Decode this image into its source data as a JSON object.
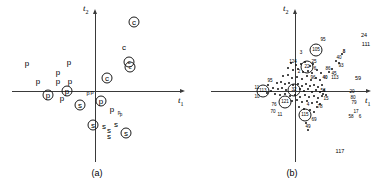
{
  "figure": {
    "panels": [
      {
        "id": "a",
        "caption": "(a)",
        "axes": {
          "x_label": "t",
          "x_sub": "1",
          "y_label": "t",
          "y_sub": "2"
        },
        "origin": {
          "x": 95,
          "y": 91
        },
        "markers": [
          {
            "label": "p",
            "x": 27,
            "y": 64,
            "circled": false,
            "size": "big"
          },
          {
            "label": "p",
            "x": 69,
            "y": 63,
            "circled": false,
            "size": "big"
          },
          {
            "label": "p",
            "x": 58,
            "y": 73,
            "circled": false,
            "size": "big"
          },
          {
            "label": "p",
            "x": 38,
            "y": 82,
            "circled": false,
            "size": "big"
          },
          {
            "label": "p",
            "x": 58,
            "y": 82,
            "circled": false,
            "size": "big"
          },
          {
            "label": "p",
            "x": 70,
            "y": 82,
            "circled": false,
            "size": "big"
          },
          {
            "label": "p",
            "x": 48,
            "y": 95,
            "circled": true,
            "size": "big"
          },
          {
            "label": "p",
            "x": 67,
            "y": 91,
            "circled": true,
            "size": "big"
          },
          {
            "label": "p",
            "x": 62,
            "y": 99,
            "circled": false,
            "size": "big"
          },
          {
            "label": "p",
            "x": 88,
            "y": 94,
            "circled": false,
            "size": "small"
          },
          {
            "label": "p",
            "x": 92,
            "y": 93,
            "circled": false,
            "size": "small"
          },
          {
            "label": "p",
            "x": 101,
            "y": 101,
            "circled": true,
            "size": "big"
          },
          {
            "label": "p",
            "x": 112,
            "y": 110,
            "circled": false,
            "size": "big"
          },
          {
            "label": "p",
            "x": 119,
            "y": 113,
            "circled": false,
            "size": "tiny"
          },
          {
            "label": "p",
            "x": 121,
            "y": 115,
            "circled": false,
            "size": "tiny"
          },
          {
            "label": "s",
            "x": 80,
            "y": 105,
            "circled": true,
            "size": "big"
          },
          {
            "label": "s",
            "x": 93,
            "y": 125,
            "circled": true,
            "size": "big"
          },
          {
            "label": "s",
            "x": 104,
            "y": 127,
            "circled": false,
            "size": "big"
          },
          {
            "label": "s",
            "x": 116,
            "y": 125,
            "circled": false,
            "size": "big"
          },
          {
            "label": "s",
            "x": 109,
            "y": 131,
            "circled": false,
            "size": "big"
          },
          {
            "label": "s",
            "x": 109,
            "y": 137,
            "circled": false,
            "size": "big"
          },
          {
            "label": "s",
            "x": 126,
            "y": 133,
            "circled": true,
            "size": "big"
          },
          {
            "label": "c",
            "x": 134,
            "y": 22,
            "circled": true,
            "size": "big"
          },
          {
            "label": "c",
            "x": 124,
            "y": 48,
            "circled": false,
            "size": "big"
          },
          {
            "label": "c",
            "x": 129,
            "y": 62,
            "circled": true,
            "size": "small"
          },
          {
            "label": "c",
            "x": 130,
            "y": 67,
            "circled": true,
            "size": "small"
          },
          {
            "label": "c",
            "x": 107,
            "y": 78,
            "circled": true,
            "size": "big"
          }
        ]
      },
      {
        "id": "b",
        "caption": "(b)",
        "axes": {
          "x_label": "t",
          "x_sub": "1",
          "y_label": "t",
          "y_sub": "2"
        },
        "origin": {
          "x": 100,
          "y": 91
        },
        "labels": [
          {
            "text": "24",
            "x": 169,
            "y": 36,
            "size": "small"
          },
          {
            "text": "111",
            "x": 171,
            "y": 45,
            "size": "small"
          },
          {
            "text": "95",
            "x": 128,
            "y": 40,
            "size": "tiny"
          },
          {
            "text": "105",
            "x": 121,
            "y": 50,
            "circled": true,
            "size": "tiny"
          },
          {
            "text": "8",
            "x": 149,
            "y": 52,
            "size": "tiny",
            "bold": true
          },
          {
            "text": "40",
            "x": 144,
            "y": 58,
            "size": "tiny"
          },
          {
            "text": "93",
            "x": 146,
            "y": 66,
            "size": "tiny"
          },
          {
            "text": "3",
            "x": 106,
            "y": 53,
            "size": "tiny"
          },
          {
            "text": "25",
            "x": 119,
            "y": 62,
            "size": "tiny"
          },
          {
            "text": "124",
            "x": 98,
            "y": 62,
            "size": "tiny"
          },
          {
            "text": "22",
            "x": 112,
            "y": 67,
            "circled": true,
            "size": "tiny"
          },
          {
            "text": "6",
            "x": 120,
            "y": 69,
            "size": "tiny"
          },
          {
            "text": "86",
            "x": 133,
            "y": 69,
            "size": "tiny"
          },
          {
            "text": "45",
            "x": 139,
            "y": 74,
            "size": "tiny"
          },
          {
            "text": "40",
            "x": 130,
            "y": 78,
            "size": "tiny",
            "bold": true
          },
          {
            "text": "113",
            "x": 140,
            "y": 78,
            "size": "tiny"
          },
          {
            "text": "2",
            "x": 104,
            "y": 72,
            "size": "tiny"
          },
          {
            "text": "96",
            "x": 118,
            "y": 78,
            "size": "tiny"
          },
          {
            "text": "95",
            "x": 75,
            "y": 81,
            "size": "tiny"
          },
          {
            "text": "59",
            "x": 163,
            "y": 79,
            "size": "small"
          },
          {
            "text": "11",
            "x": 62,
            "y": 88,
            "size": "tiny"
          },
          {
            "text": "113",
            "x": 68,
            "y": 91,
            "circled": true,
            "size": "tiny"
          },
          {
            "text": "32",
            "x": 99,
            "y": 90,
            "circled": true,
            "size": "tiny"
          },
          {
            "text": "53",
            "x": 128,
            "y": 91,
            "size": "tiny"
          },
          {
            "text": "20",
            "x": 157,
            "y": 92,
            "size": "tiny"
          },
          {
            "text": "10",
            "x": 62,
            "y": 97,
            "size": "tiny"
          },
          {
            "text": "80",
            "x": 158,
            "y": 98,
            "size": "tiny"
          },
          {
            "text": "79",
            "x": 159,
            "y": 103,
            "size": "tiny"
          },
          {
            "text": "15",
            "x": 131,
            "y": 99,
            "size": "tiny"
          },
          {
            "text": "121",
            "x": 90,
            "y": 102,
            "circled": true,
            "size": "tiny"
          },
          {
            "text": "76",
            "x": 79,
            "y": 105,
            "size": "tiny"
          },
          {
            "text": "4",
            "x": 113,
            "y": 105,
            "size": "tiny"
          },
          {
            "text": "70",
            "x": 78,
            "y": 112,
            "size": "tiny"
          },
          {
            "text": "11",
            "x": 85,
            "y": 115,
            "size": "tiny"
          },
          {
            "text": "78",
            "x": 125,
            "y": 107,
            "size": "tiny"
          },
          {
            "text": "17",
            "x": 161,
            "y": 112,
            "size": "tiny"
          },
          {
            "text": "58",
            "x": 156,
            "y": 117,
            "size": "tiny"
          },
          {
            "text": "6",
            "x": 165,
            "y": 117,
            "size": "tiny"
          },
          {
            "text": "115",
            "x": 110,
            "y": 115,
            "circled": true,
            "size": "tiny"
          },
          {
            "text": "69",
            "x": 119,
            "y": 120,
            "size": "tiny"
          },
          {
            "text": "49",
            "x": 113,
            "y": 127,
            "size": "tiny"
          },
          {
            "text": "117",
            "x": 145,
            "y": 152,
            "size": "small"
          }
        ],
        "dots": [
          {
            "x": 96,
            "y": 63
          },
          {
            "x": 101,
            "y": 65
          },
          {
            "x": 106,
            "y": 64
          },
          {
            "x": 110,
            "y": 62
          },
          {
            "x": 115,
            "y": 66
          },
          {
            "x": 118,
            "y": 64
          },
          {
            "x": 93,
            "y": 68
          },
          {
            "x": 98,
            "y": 70
          },
          {
            "x": 103,
            "y": 69
          },
          {
            "x": 108,
            "y": 72
          },
          {
            "x": 113,
            "y": 71
          },
          {
            "x": 117,
            "y": 73
          },
          {
            "x": 122,
            "y": 70
          },
          {
            "x": 126,
            "y": 73
          },
          {
            "x": 88,
            "y": 76
          },
          {
            "x": 93,
            "y": 75
          },
          {
            "x": 97,
            "y": 78
          },
          {
            "x": 102,
            "y": 77
          },
          {
            "x": 107,
            "y": 79
          },
          {
            "x": 112,
            "y": 76
          },
          {
            "x": 116,
            "y": 80
          },
          {
            "x": 121,
            "y": 78
          },
          {
            "x": 125,
            "y": 80
          },
          {
            "x": 82,
            "y": 83
          },
          {
            "x": 86,
            "y": 82
          },
          {
            "x": 90,
            "y": 84
          },
          {
            "x": 94,
            "y": 83
          },
          {
            "x": 98,
            "y": 85
          },
          {
            "x": 103,
            "y": 84
          },
          {
            "x": 107,
            "y": 86
          },
          {
            "x": 111,
            "y": 84
          },
          {
            "x": 115,
            "y": 86
          },
          {
            "x": 119,
            "y": 85
          },
          {
            "x": 123,
            "y": 87
          },
          {
            "x": 127,
            "y": 85
          },
          {
            "x": 78,
            "y": 88
          },
          {
            "x": 83,
            "y": 89
          },
          {
            "x": 87,
            "y": 88
          },
          {
            "x": 91,
            "y": 90
          },
          {
            "x": 105,
            "y": 89
          },
          {
            "x": 109,
            "y": 91
          },
          {
            "x": 113,
            "y": 89
          },
          {
            "x": 117,
            "y": 92
          },
          {
            "x": 121,
            "y": 90
          },
          {
            "x": 125,
            "y": 92
          },
          {
            "x": 129,
            "y": 90
          },
          {
            "x": 80,
            "y": 94
          },
          {
            "x": 85,
            "y": 95
          },
          {
            "x": 90,
            "y": 94
          },
          {
            "x": 95,
            "y": 96
          },
          {
            "x": 100,
            "y": 95
          },
          {
            "x": 105,
            "y": 97
          },
          {
            "x": 110,
            "y": 95
          },
          {
            "x": 114,
            "y": 97
          },
          {
            "x": 119,
            "y": 96
          },
          {
            "x": 123,
            "y": 98
          },
          {
            "x": 127,
            "y": 96
          },
          {
            "x": 97,
            "y": 101
          },
          {
            "x": 102,
            "y": 100
          },
          {
            "x": 107,
            "y": 102
          },
          {
            "x": 112,
            "y": 101
          },
          {
            "x": 117,
            "y": 103
          },
          {
            "x": 122,
            "y": 102
          },
          {
            "x": 104,
            "y": 107
          },
          {
            "x": 109,
            "y": 109
          },
          {
            "x": 119,
            "y": 112
          },
          {
            "x": 115,
            "y": 110
          },
          {
            "x": 111,
            "y": 123
          },
          {
            "x": 113,
            "y": 130
          },
          {
            "x": 134,
            "y": 72
          },
          {
            "x": 137,
            "y": 69
          },
          {
            "x": 141,
            "y": 61
          },
          {
            "x": 147,
            "y": 54
          },
          {
            "x": 144,
            "y": 63
          },
          {
            "x": 128,
            "y": 94
          },
          {
            "x": 131,
            "y": 95
          },
          {
            "x": 125,
            "y": 104
          },
          {
            "x": 122,
            "y": 107
          },
          {
            "x": 73,
            "y": 85
          },
          {
            "x": 76,
            "y": 91
          },
          {
            "x": 72,
            "y": 93
          }
        ]
      }
    ]
  }
}
